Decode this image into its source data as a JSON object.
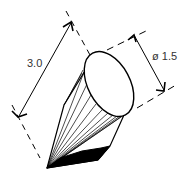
{
  "diagram": {
    "type": "technical-drawing",
    "dimensions": {
      "length_label": "3.0",
      "diameter_label": "ø 1.5"
    },
    "colors": {
      "stroke": "#000000",
      "text": "#333333",
      "background": "#ffffff"
    }
  }
}
